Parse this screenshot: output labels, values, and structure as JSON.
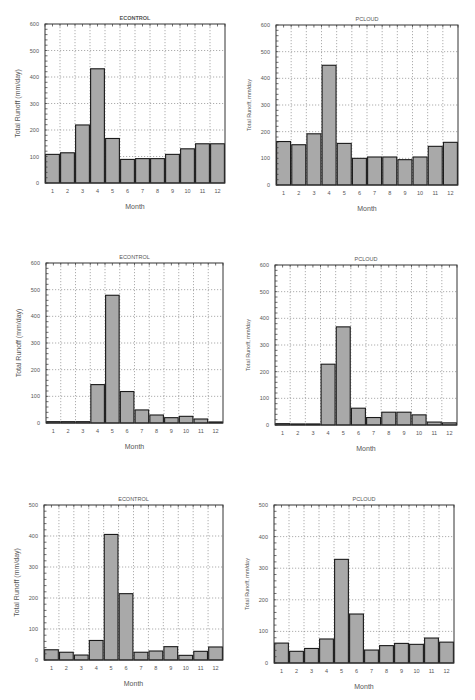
{
  "chart_data": [
    {
      "type": "bar",
      "title": "ECONTROL",
      "xlabel": "Month",
      "ylabel": "Total Runoff (mm/day)",
      "categories": [
        "1",
        "2",
        "3",
        "4",
        "5",
        "6",
        "7",
        "8",
        "9",
        "10",
        "11",
        "12"
      ],
      "values": [
        108,
        114,
        219,
        431,
        168,
        89,
        92,
        92,
        108,
        129,
        148,
        148
      ],
      "ylim": [
        0,
        600
      ],
      "yticks": [
        0,
        100,
        200,
        300,
        400,
        500,
        600
      ],
      "grid": true,
      "frame": {
        "x": 45,
        "y": 24,
        "w": 180,
        "h": 159
      },
      "title_bold": true
    },
    {
      "type": "bar",
      "title": "PCLOUD",
      "xlabel": "Month",
      "ylabel": "Total Runoff, mm/day",
      "categories": [
        "1",
        "2",
        "3",
        "4",
        "5",
        "6",
        "7",
        "8",
        "9",
        "10",
        "11",
        "12"
      ],
      "values": [
        163,
        151,
        192,
        449,
        156,
        100,
        105,
        105,
        95,
        105,
        145,
        160
      ],
      "ylim": [
        0,
        600
      ],
      "yticks": [
        0,
        100,
        200,
        300,
        400,
        500,
        600
      ],
      "grid": true,
      "frame": {
        "x": 276,
        "y": 25,
        "w": 182,
        "h": 160
      },
      "title_bold": false
    },
    {
      "type": "bar",
      "title": "ECONTROL",
      "xlabel": "Month",
      "ylabel": "Total Runoff (mm/day)",
      "categories": [
        "1",
        "2",
        "3",
        "4",
        "5",
        "6",
        "7",
        "8",
        "9",
        "10",
        "11",
        "12"
      ],
      "values": [
        5,
        5,
        5,
        144,
        479,
        118,
        49,
        30,
        20,
        25,
        15,
        4
      ],
      "ylim": [
        0,
        600
      ],
      "yticks": [
        0,
        100,
        200,
        300,
        400,
        500,
        600
      ],
      "grid": true,
      "frame": {
        "x": 46,
        "y": 263,
        "w": 177,
        "h": 160
      },
      "title_bold": false
    },
    {
      "type": "bar",
      "title": "PCLOUD",
      "xlabel": "Month",
      "ylabel": "Total Runoff, mm/day",
      "categories": [
        "1",
        "2",
        "3",
        "4",
        "5",
        "6",
        "7",
        "8",
        "9",
        "10",
        "11",
        "12"
      ],
      "values": [
        5,
        4,
        4,
        228,
        368,
        63,
        28,
        48,
        48,
        38,
        11,
        8
      ],
      "ylim": [
        0,
        600
      ],
      "yticks": [
        0,
        100,
        200,
        300,
        400,
        500,
        600
      ],
      "grid": true,
      "frame": {
        "x": 275,
        "y": 265,
        "w": 182,
        "h": 160
      },
      "title_bold": false
    },
    {
      "type": "bar",
      "title": "ECONTROL",
      "xlabel": "Month",
      "ylabel": "Total Runoff (mm/day)",
      "categories": [
        "1",
        "2",
        "3",
        "4",
        "5",
        "6",
        "7",
        "8",
        "9",
        "10",
        "11",
        "12"
      ],
      "values": [
        33,
        25,
        16,
        63,
        405,
        214,
        25,
        29,
        43,
        15,
        28,
        42
      ],
      "ylim": [
        0,
        500
      ],
      "yticks": [
        0,
        100,
        200,
        300,
        400,
        500
      ],
      "grid": true,
      "frame": {
        "x": 44,
        "y": 505,
        "w": 179,
        "h": 155
      },
      "title_bold": false
    },
    {
      "type": "bar",
      "title": "PCLOUD",
      "xlabel": "Month",
      "ylabel": "Total Runoff, mm/day",
      "categories": [
        "1",
        "2",
        "3",
        "4",
        "5",
        "6",
        "7",
        "8",
        "9",
        "10",
        "11",
        "12"
      ],
      "values": [
        63,
        37,
        46,
        76,
        328,
        155,
        41,
        55,
        62,
        59,
        79,
        66
      ],
      "ylim": [
        0,
        500
      ],
      "yticks": [
        0,
        100,
        200,
        300,
        400,
        500
      ],
      "grid": true,
      "frame": {
        "x": 274,
        "y": 505,
        "w": 180,
        "h": 158
      },
      "title_bold": false
    }
  ],
  "style": {
    "bar_fill": "#a9a9a9",
    "bar_stroke": "#1a1a1a",
    "grid_color": "#777777",
    "axis_color": "#333333",
    "text_color": "#555555"
  }
}
